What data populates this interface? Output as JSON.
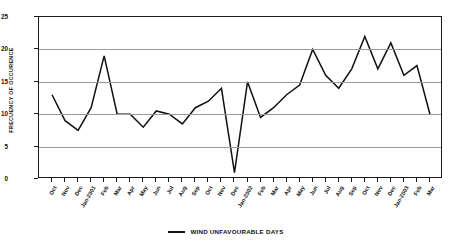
{
  "chart_data": {
    "type": "line",
    "title": "",
    "xlabel": "",
    "ylabel": "FRECUENCY OF OCCURENCE",
    "ylim": [
      0,
      25
    ],
    "yticks": [
      0,
      5,
      10,
      15,
      20,
      25
    ],
    "grid": true,
    "legend_position": "bottom-center",
    "categories": [
      "Oct",
      "Nov",
      "Dec",
      "Jan-2001",
      "Feb",
      "Mar",
      "Apr",
      "May",
      "Jun",
      "Jul",
      "Aug",
      "Sep",
      "Oct",
      "Nov",
      "Dec",
      "Jan-2002",
      "Feb",
      "Mar",
      "Apr",
      "May",
      "Jun",
      "Jul",
      "Aug",
      "Sep",
      "Oct",
      "Nov",
      "Dec",
      "Jan-2003",
      "Feb",
      "Mar"
    ],
    "series": [
      {
        "name": "WIND UNFAVOURABLE DAYS",
        "color": "#111111",
        "values": [
          13,
          9,
          7.5,
          11,
          19,
          10,
          10,
          8,
          10.5,
          10,
          8.5,
          11,
          12,
          14,
          1,
          15,
          9.5,
          11,
          13,
          14.5,
          20,
          16,
          14,
          17,
          22,
          17,
          21,
          16,
          17.5,
          10
        ]
      }
    ]
  },
  "legend": {
    "label": "WIND UNFAVOURABLE DAYS"
  },
  "axis": {
    "y_title": "FRECUENCY OF OCCURENCE"
  }
}
